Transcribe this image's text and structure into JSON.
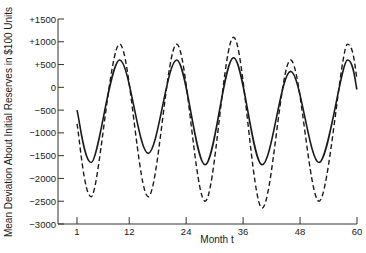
{
  "chart_data": {
    "type": "line",
    "title": "",
    "xlabel": "Month t",
    "ylabel": "Mean Deviation About Initial Reserves in $100 Units",
    "xlim": [
      1,
      60
    ],
    "ylim": [
      -3000,
      1500
    ],
    "x_ticks": [
      1,
      12,
      24,
      36,
      48,
      60
    ],
    "y_ticks": [
      1500,
      1000,
      500,
      0,
      -500,
      -1000,
      -1500,
      -2000,
      -2500,
      -3000
    ],
    "y_tick_labels": [
      "+1500",
      "+1000",
      "+500",
      "0",
      "−500",
      "−1000",
      "−1500",
      "−2000",
      "−2500",
      "−3000"
    ],
    "grid": false,
    "legend": null,
    "series": [
      {
        "name": "solid",
        "style": "solid",
        "points": [
          [
            1,
            -500
          ],
          [
            4,
            -1650
          ],
          [
            10,
            600
          ],
          [
            16,
            -1450
          ],
          [
            22,
            600
          ],
          [
            28,
            -1700
          ],
          [
            34,
            650
          ],
          [
            40,
            -1700
          ],
          [
            46,
            350
          ],
          [
            52,
            -1650
          ],
          [
            58,
            600
          ],
          [
            60,
            -50
          ]
        ]
      },
      {
        "name": "dashed",
        "style": "dashed",
        "points": [
          [
            1,
            -800
          ],
          [
            4,
            -2400
          ],
          [
            10,
            950
          ],
          [
            16,
            -2400
          ],
          [
            22,
            950
          ],
          [
            28,
            -2500
          ],
          [
            34,
            1100
          ],
          [
            40,
            -2650
          ],
          [
            46,
            600
          ],
          [
            52,
            -2500
          ],
          [
            58,
            950
          ],
          [
            60,
            200
          ]
        ]
      }
    ]
  }
}
